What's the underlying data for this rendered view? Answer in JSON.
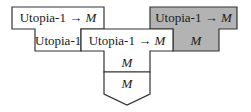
{
  "diagram": {
    "type": "T-diagram (compiler bootstrapping)",
    "left_compiler": {
      "top_label_source": "Utopia-1",
      "top_label_arrow": "→",
      "top_label_target": "M",
      "bottom_label": "Utopia-1",
      "fill": "#ffffff"
    },
    "center_compiler": {
      "top_label_source": "Utopia-1",
      "top_label_arrow": "→",
      "top_label_target": "M",
      "stem_label": "M",
      "fill": "#ffffff"
    },
    "right_compiler": {
      "top_label_source": "Utopia-1",
      "top_label_arrow": "→",
      "top_label_target": "M",
      "stem_label": "M",
      "fill": "#b3b3b3"
    },
    "machine": {
      "label": "M",
      "shape": "pentagon"
    },
    "colors": {
      "stroke": "#333333",
      "shaded": "#b3b3b3",
      "background": "#ffffff"
    }
  }
}
